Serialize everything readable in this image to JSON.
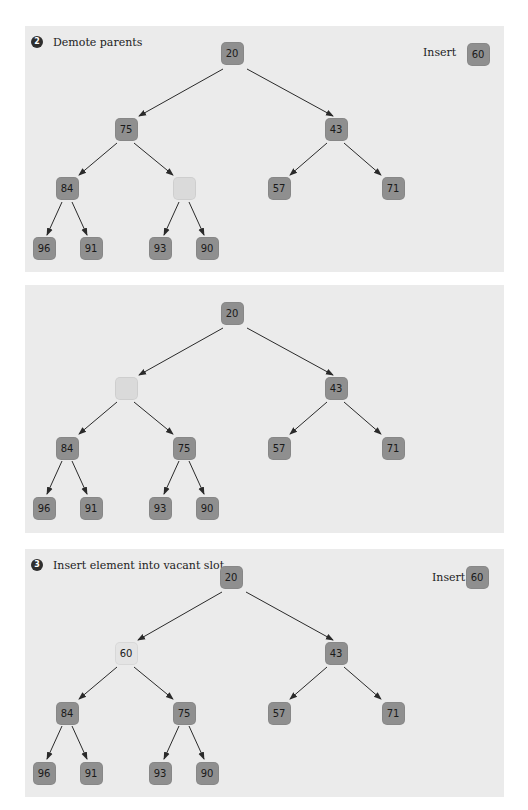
{
  "colors": {
    "panel_bg": "#ebebeb",
    "node_fill": "#8f8f8f",
    "vacant_fill": "#dadada",
    "placed_fill": "#e4e4e4",
    "badge_fill": "#2e2e2e",
    "arrow": "#2a2a2a"
  },
  "panels": [
    {
      "step_number": "2",
      "title": "Demote parents",
      "insert_label": "Insert",
      "insert_value": "60",
      "nodes": {
        "root": "20",
        "l1_left": "75",
        "l1_right": "43",
        "l2_a": "84",
        "l2_b": "",
        "l2_c": "57",
        "l2_d": "71",
        "l3_a": "96",
        "l3_b": "91",
        "l3_c": "93",
        "l3_d": "90"
      },
      "vacant": "l2_b"
    },
    {
      "step_number": "",
      "title": "",
      "nodes": {
        "root": "20",
        "l1_left": "",
        "l1_right": "43",
        "l2_a": "84",
        "l2_b": "75",
        "l2_c": "57",
        "l2_d": "71",
        "l3_a": "96",
        "l3_b": "91",
        "l3_c": "93",
        "l3_d": "90"
      },
      "vacant": "l1_left"
    },
    {
      "step_number": "3",
      "title": "Insert element into vacant slot",
      "insert_label": "Insert",
      "insert_value": "60",
      "nodes": {
        "root": "20",
        "l1_left": "60",
        "l1_right": "43",
        "l2_a": "84",
        "l2_b": "75",
        "l2_c": "57",
        "l2_d": "71",
        "l3_a": "96",
        "l3_b": "91",
        "l3_c": "93",
        "l3_d": "90"
      },
      "placed": "l1_left"
    }
  ]
}
